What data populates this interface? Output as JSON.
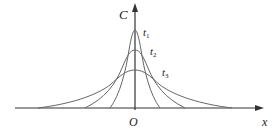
{
  "diagram": {
    "y_axis_label": "C",
    "x_axis_label": "x",
    "origin_label": "O",
    "curves": [
      {
        "label": "t",
        "sub": "1"
      },
      {
        "label": "t",
        "sub": "2"
      },
      {
        "label": "t",
        "sub": "3"
      }
    ],
    "colors": {
      "axis": "#333333",
      "curve": "#666666"
    }
  }
}
